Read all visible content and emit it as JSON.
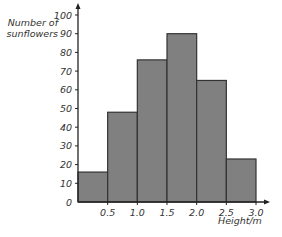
{
  "chart_data": {
    "type": "bar",
    "title": "",
    "xlabel": "Height/m",
    "ylabel": "Number of sunflowers",
    "categories": [
      "0–0.5",
      "0.5–1.0",
      "1.0–1.5",
      "1.5–2.0",
      "2.0–2.5",
      "2.5–3.0"
    ],
    "bin_edges": [
      0,
      0.5,
      1.0,
      1.5,
      2.0,
      2.5,
      3.0
    ],
    "values": [
      16,
      48,
      76,
      90,
      65,
      23
    ],
    "ylim": [
      0,
      100
    ],
    "xlim": [
      0,
      3.0
    ],
    "y_ticks": [
      0,
      10,
      20,
      30,
      40,
      50,
      60,
      70,
      80,
      90,
      100
    ],
    "x_ticks": [
      "0.5",
      "1.0",
      "1.5",
      "2.0",
      "2.5",
      "3.0"
    ],
    "grid": false,
    "histogram": true,
    "bar_color": "#808080",
    "edge_color": "#333333"
  },
  "labels": {
    "ylabel_line1": "Number of",
    "ylabel_line2": "sunflowers",
    "xlabel": "Height/m"
  }
}
